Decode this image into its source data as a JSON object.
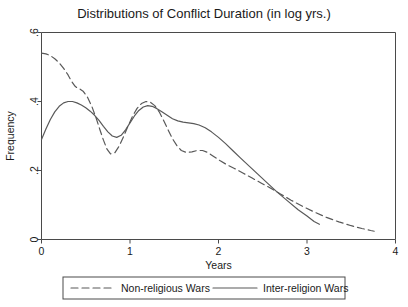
{
  "chart_data": {
    "type": "line",
    "title": "Distributions of Conflict Duration (in log yrs.)",
    "xlabel": "Years",
    "ylabel": "Frequency",
    "xlim": [
      0,
      4
    ],
    "ylim": [
      0,
      0.6
    ],
    "xticks": [
      0,
      1,
      2,
      3,
      4
    ],
    "xtick_labels": [
      "0",
      "1",
      "2",
      "3",
      "4"
    ],
    "yticks": [
      0,
      0.2,
      0.4,
      0.6
    ],
    "ytick_labels": [
      "0",
      ".2",
      ".4",
      ".6"
    ],
    "grid": false,
    "legend_position": "below-axes",
    "line_color": "#595959",
    "series": [
      {
        "name": "Non-religious Wars",
        "style": "dashed",
        "x": [
          0.0,
          0.05,
          0.1,
          0.15,
          0.2,
          0.25,
          0.3,
          0.34,
          0.38,
          0.41,
          0.43,
          0.47,
          0.52,
          0.57,
          0.62,
          0.66,
          0.7,
          0.74,
          0.78,
          0.83,
          0.88,
          0.93,
          0.98,
          1.03,
          1.08,
          1.13,
          1.18,
          1.23,
          1.28,
          1.33,
          1.38,
          1.43,
          1.48,
          1.53,
          1.58,
          1.64,
          1.7,
          1.76,
          1.82,
          1.88,
          1.95,
          2.02,
          2.1,
          2.18,
          2.28,
          2.38,
          2.48,
          2.58,
          2.7,
          2.82,
          2.95,
          3.08,
          3.22,
          3.36,
          3.5,
          3.62,
          3.72,
          3.76
        ],
        "y": [
          0.54,
          0.538,
          0.533,
          0.524,
          0.512,
          0.496,
          0.477,
          0.458,
          0.444,
          0.438,
          0.437,
          0.43,
          0.412,
          0.385,
          0.35,
          0.318,
          0.288,
          0.262,
          0.248,
          0.252,
          0.272,
          0.3,
          0.33,
          0.358,
          0.38,
          0.394,
          0.4,
          0.398,
          0.388,
          0.37,
          0.345,
          0.318,
          0.292,
          0.272,
          0.258,
          0.252,
          0.254,
          0.258,
          0.258,
          0.252,
          0.24,
          0.228,
          0.216,
          0.206,
          0.192,
          0.178,
          0.164,
          0.15,
          0.132,
          0.114,
          0.096,
          0.08,
          0.064,
          0.051,
          0.04,
          0.032,
          0.026,
          0.024
        ]
      },
      {
        "name": "Inter-religion Wars",
        "style": "solid",
        "x": [
          0.0,
          0.05,
          0.1,
          0.15,
          0.2,
          0.25,
          0.3,
          0.35,
          0.4,
          0.45,
          0.5,
          0.55,
          0.6,
          0.65,
          0.7,
          0.75,
          0.8,
          0.85,
          0.9,
          0.95,
          1.0,
          1.05,
          1.1,
          1.15,
          1.2,
          1.25,
          1.3,
          1.36,
          1.42,
          1.48,
          1.54,
          1.6,
          1.66,
          1.72,
          1.78,
          1.85,
          1.92,
          2.0,
          2.08,
          2.16,
          2.25,
          2.35,
          2.45,
          2.55,
          2.66,
          2.78,
          2.9,
          3.0,
          3.08,
          3.14
        ],
        "y": [
          0.29,
          0.32,
          0.348,
          0.37,
          0.386,
          0.396,
          0.4,
          0.4,
          0.396,
          0.39,
          0.382,
          0.372,
          0.36,
          0.345,
          0.328,
          0.312,
          0.3,
          0.296,
          0.302,
          0.318,
          0.338,
          0.358,
          0.374,
          0.384,
          0.388,
          0.386,
          0.38,
          0.37,
          0.36,
          0.35,
          0.344,
          0.34,
          0.338,
          0.336,
          0.332,
          0.324,
          0.312,
          0.296,
          0.278,
          0.258,
          0.236,
          0.212,
          0.188,
          0.164,
          0.138,
          0.112,
          0.086,
          0.068,
          0.052,
          0.044
        ]
      }
    ]
  },
  "legend": {
    "items": [
      {
        "label": "Non-religious Wars",
        "style": "dashed"
      },
      {
        "label": "Inter-religion Wars",
        "style": "solid"
      }
    ]
  }
}
